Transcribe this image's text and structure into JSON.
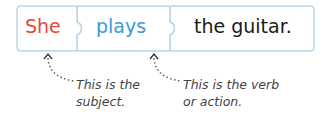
{
  "sentence": {
    "words": [
      {
        "text": "She",
        "role": "subject",
        "color": "#e5483a"
      },
      {
        "text": "plays",
        "role": "verb",
        "color": "#3a9bd6"
      },
      {
        "text": "the guitar.",
        "role": "object",
        "color": "#1a1a1a"
      }
    ]
  },
  "annotations": [
    {
      "line1": "This is the",
      "line2": "subject."
    },
    {
      "line1": "This is the verb",
      "line2": "or action."
    }
  ],
  "colors": {
    "piece_border": "#b9d6e8",
    "piece_fill": "#ffffff",
    "dotted_line": "#666666"
  }
}
